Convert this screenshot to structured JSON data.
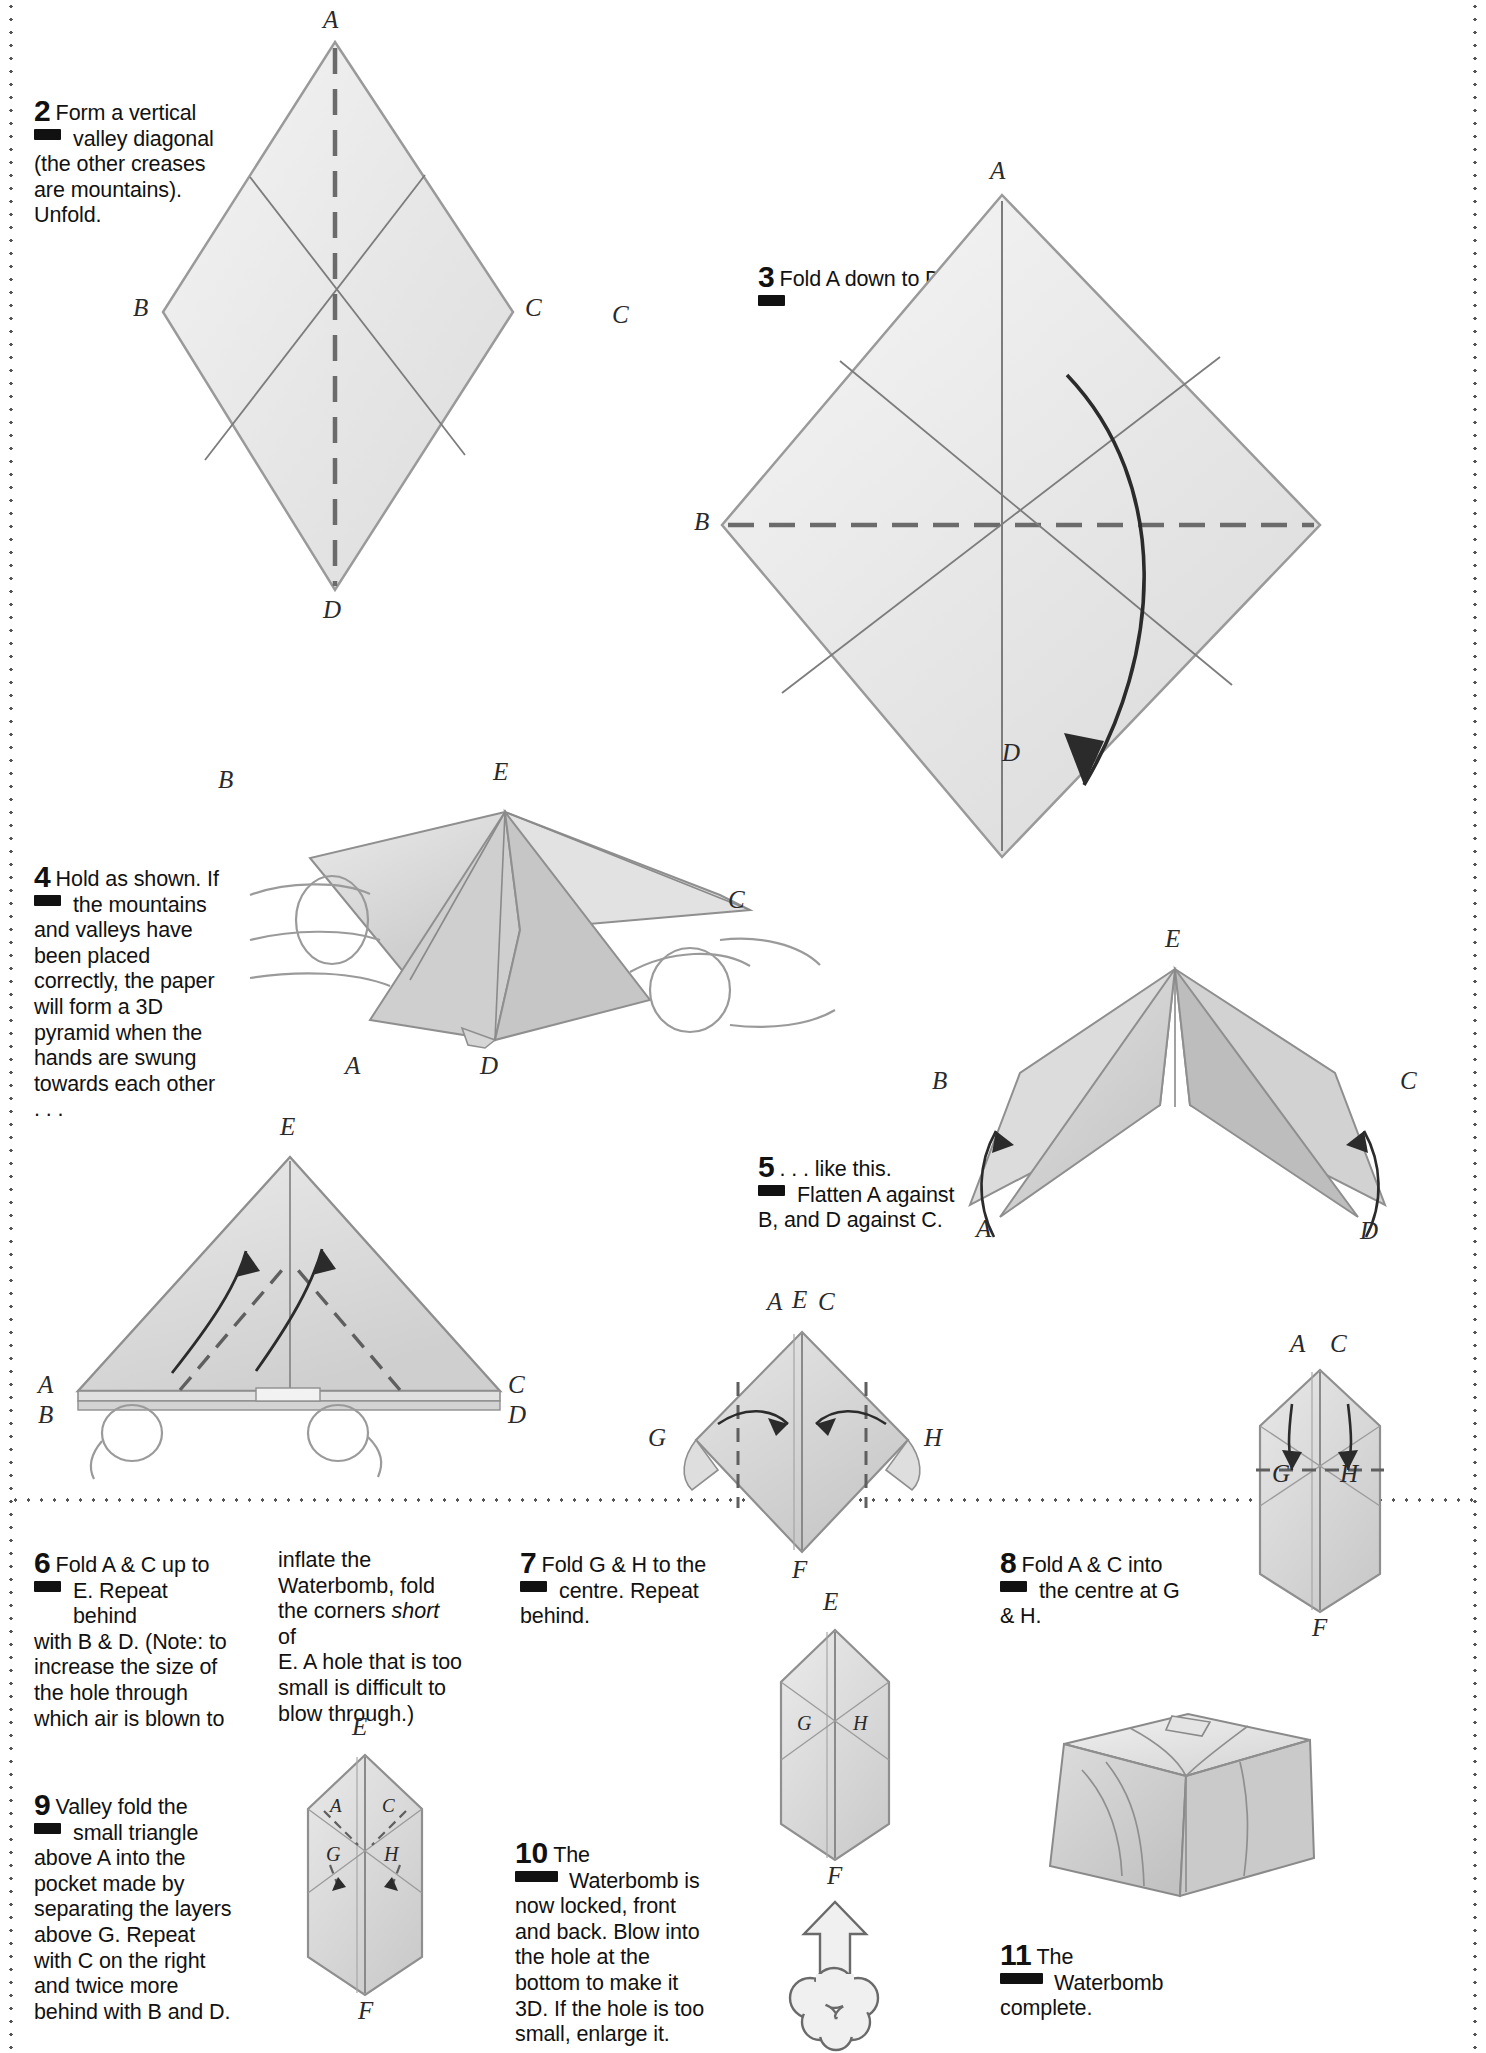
{
  "page": {
    "ink_color": "#111111",
    "paper_fill": "#efefef",
    "shade_fill": "#cfcfcf"
  },
  "steps": [
    {
      "number": "2",
      "text": "Form a vertical valley diagonal (the other creases are mountains). Unfold.",
      "lines": [
        "Form a vertical",
        "valley diagonal",
        "(the other creases",
        "are mountains).",
        "Unfold."
      ]
    },
    {
      "number": "3",
      "text": "Fold A down to D.",
      "lines": [
        "Fold A down to D."
      ]
    },
    {
      "number": "4",
      "text": "Hold as shown. If the mountains and valleys have been placed correctly, the paper will form a 3D pyramid when the hands are swung towards each other . . .",
      "lines": [
        "Hold as shown. If",
        "the mountains",
        "and valleys have",
        "been placed",
        "correctly, the paper",
        "will form a 3D",
        "pyramid when the",
        "hands are swung",
        "towards each other",
        ". . ."
      ]
    },
    {
      "number": "5",
      "text": ". . . like this. Flatten A against B, and D against C.",
      "lines": [
        ". . . like this.",
        "Flatten A against",
        "B, and D against C."
      ]
    },
    {
      "number": "6",
      "text": "Fold A & C up to E. Repeat behind with B & D. (Note: to increase the size of the hole through which air is blown to",
      "lines": [
        "Fold A & C up to",
        "E. Repeat behind",
        "with B & D. (Note: to",
        "increase the size of",
        "the hole through",
        "which air is blown to"
      ],
      "continuation_lines": [
        "inflate the",
        "Waterbomb, fold",
        "the corners short of",
        "E. A hole that is too",
        "small is difficult to",
        "blow through.)"
      ],
      "continuation_italic_word": "short"
    },
    {
      "number": "7",
      "text": "Fold G & H to the centre. Repeat behind.",
      "lines": [
        "Fold G & H to the",
        "centre. Repeat",
        "behind."
      ]
    },
    {
      "number": "8",
      "text": "Fold A & C into the centre at G & H.",
      "lines": [
        "Fold A & C into",
        "the centre at G",
        "& H."
      ]
    },
    {
      "number": "9",
      "text": "Valley fold the small triangle above A into the pocket made by separating the layers above G. Repeat with C on the right and twice more behind with B and D.",
      "lines": [
        "Valley fold the",
        "small triangle",
        "above A into the",
        "pocket made by",
        "separating the layers",
        "above G. Repeat",
        "with C on the right",
        "and twice more",
        "behind with B and D."
      ]
    },
    {
      "number": "10",
      "text": "The Waterbomb is now locked, front and back. Blow into the hole at the bottom to make it 3D. If the hole is too small, enlarge it.",
      "lines": [
        "The",
        "Waterbomb is",
        "now locked, front",
        "and back. Blow into",
        "the hole at the",
        "bottom to make it",
        "3D. If the hole is too",
        "small, enlarge it."
      ]
    },
    {
      "number": "11",
      "text": "The Waterbomb complete.",
      "lines": [
        "The",
        "Waterbomb",
        "complete."
      ]
    }
  ],
  "diagrams": {
    "d2": {
      "name": "square-with-diagonal-creases",
      "labels": [
        "A",
        "B",
        "C",
        "D"
      ]
    },
    "d3": {
      "name": "square-fold-a-down-to-d",
      "labels": [
        "A",
        "B",
        "C",
        "D"
      ]
    },
    "d4": {
      "name": "hands-holding-3d-pyramid",
      "labels": [
        "A",
        "B",
        "C",
        "D",
        "E"
      ]
    },
    "d5": {
      "name": "flattened-star-shape",
      "labels": [
        "A",
        "B",
        "C",
        "D",
        "E"
      ]
    },
    "d6": {
      "name": "waterbomb-base-triangle",
      "labels": [
        "A",
        "B",
        "C",
        "D",
        "E"
      ]
    },
    "d7": {
      "name": "diamond-with-g-h-flaps",
      "labels": [
        "A",
        "C",
        "E",
        "F",
        "G",
        "H"
      ]
    },
    "d8": {
      "name": "narrow-hexagon-with-g-h",
      "labels": [
        "A",
        "C",
        "F",
        "G",
        "H"
      ]
    },
    "d9": {
      "name": "hexagon-tuck-triangles",
      "labels": [
        "A",
        "C",
        "E",
        "F",
        "G",
        "H"
      ]
    },
    "d10": {
      "name": "locked-waterbomb-with-blow-arrow",
      "labels": [
        "E",
        "F",
        "G",
        "H"
      ]
    },
    "d11": {
      "name": "inflated-waterbomb-cube",
      "labels": []
    }
  }
}
